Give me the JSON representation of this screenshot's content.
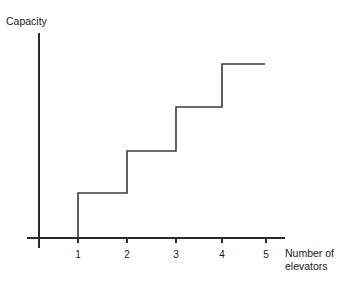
{
  "chart_data": {
    "type": "line",
    "subtype": "step",
    "title": "",
    "xlabel": "Number of elevators",
    "ylabel": "Capacity",
    "xlabel_lines": [
      "Number of",
      "elevators"
    ],
    "x_tick_labels": [
      "1",
      "2",
      "3",
      "4",
      "5"
    ],
    "x": [
      1,
      2,
      3,
      4,
      5
    ],
    "y_tick_labels": [],
    "categories": [
      "1",
      "2",
      "3",
      "4",
      "5"
    ],
    "values": [
      1,
      2,
      3,
      4,
      5
    ],
    "step_levels": [
      1,
      2,
      3,
      4,
      5
    ],
    "xlim": [
      0,
      5.6
    ],
    "ylim": [
      0,
      5.2
    ],
    "grid": false,
    "legend": false,
    "legend_position": "none",
    "annotations": [],
    "colors": {
      "line": "#3a3a3a",
      "axis": "#2b2b2b",
      "background": "#ffffff",
      "text": "#1a1a1a"
    },
    "geometry": {
      "axis_origin_x": 39,
      "axis_origin_y": 238,
      "x_axis_end": 285,
      "y_axis_top": 33,
      "y_axis_bottom": 248,
      "tick_x_positions": [
        78,
        127,
        176,
        222,
        266
      ],
      "step_rise_x": [
        78,
        127,
        176,
        222
      ],
      "step_level_y": [
        193,
        151,
        107,
        64
      ],
      "plateau_end_x": 265
    }
  },
  "labels": {
    "y_axis_title": "Capacity",
    "x_axis_title_line1": "Number of",
    "x_axis_title_line2": "elevators",
    "tick_1": "1",
    "tick_2": "2",
    "tick_3": "3",
    "tick_4": "4",
    "tick_5": "5"
  }
}
